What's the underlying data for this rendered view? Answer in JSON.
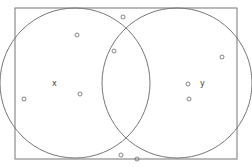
{
  "diagram": {
    "type": "venn",
    "universe": {
      "x": 15,
      "y": 8,
      "width": 222,
      "height": 151
    },
    "sets": [
      {
        "label": "x",
        "cx": 75,
        "cy": 83,
        "r": 75,
        "label_x": 52,
        "label_y": 86
      },
      {
        "label": "y",
        "cx": 177,
        "cy": 83,
        "r": 75,
        "label_x": 200,
        "label_y": 86
      }
    ],
    "points": [
      {
        "x": 77,
        "y": 35
      },
      {
        "x": 114,
        "y": 51
      },
      {
        "x": 123,
        "y": 17
      },
      {
        "x": 24,
        "y": 99
      },
      {
        "x": 80,
        "y": 94
      },
      {
        "x": 222,
        "y": 57
      },
      {
        "x": 188,
        "y": 84
      },
      {
        "x": 189,
        "y": 99
      },
      {
        "x": 121,
        "y": 155
      },
      {
        "x": 137,
        "y": 159
      }
    ],
    "colors": {
      "stroke": "#777777",
      "background": "#ffffff"
    }
  }
}
